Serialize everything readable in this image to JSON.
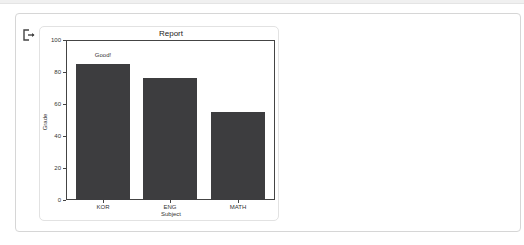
{
  "output": {
    "icon": "output-icon"
  },
  "chart_data": {
    "type": "bar",
    "title": "Report",
    "xlabel": "Subject",
    "ylabel": "Grade",
    "categories": [
      "KOR",
      "ENG",
      "MATH"
    ],
    "values": [
      85,
      76,
      55
    ],
    "ylim": [
      0,
      100
    ],
    "yticks": [
      "0",
      "20",
      "40",
      "60",
      "80",
      "100"
    ],
    "grid": false,
    "bar_color": "#3d3d3f",
    "annotations": [
      {
        "text": "Good!",
        "category": "KOR",
        "y": 90
      }
    ]
  }
}
